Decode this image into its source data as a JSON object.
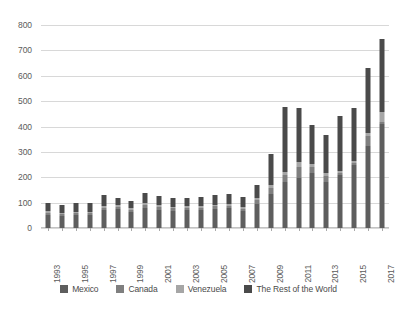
{
  "chart_data": {
    "type": "bar",
    "stacked": true,
    "title": "",
    "subtitle": "",
    "xlabel": "",
    "ylabel": "",
    "ylim": [
      0,
      800
    ],
    "ytick_step": 100,
    "yticks": [
      800,
      700,
      600,
      500,
      400,
      300,
      200,
      100,
      0
    ],
    "grid": true,
    "legend_position": "bottom",
    "categories": [
      "1993",
      "1994",
      "1995",
      "1996",
      "1997",
      "1998",
      "1999",
      "2000",
      "2001",
      "2002",
      "2003",
      "2004",
      "2005",
      "2006",
      "2007",
      "2008",
      "2009",
      "2010",
      "2011",
      "2012",
      "2013",
      "2014",
      "2015",
      "2016",
      "2017"
    ],
    "xtick_labels_shown": [
      "1993",
      "1995",
      "1997",
      "1999",
      "2001",
      "2003",
      "2005",
      "2007",
      "2009",
      "2011",
      "2013",
      "2015",
      "2017"
    ],
    "series": [
      {
        "name": "Mexico",
        "color": "#5e5e5e",
        "values": [
          52,
          48,
          50,
          52,
          70,
          75,
          63,
          80,
          72,
          68,
          70,
          70,
          75,
          78,
          66,
          95,
          135,
          180,
          198,
          215,
          180,
          208,
          248,
          325,
          410
        ]
      },
      {
        "name": "Canada",
        "color": "#7f7f7f",
        "values": [
          8,
          6,
          8,
          8,
          10,
          9,
          8,
          12,
          10,
          9,
          9,
          9,
          10,
          10,
          9,
          14,
          22,
          28,
          44,
          26,
          26,
          8,
          8,
          38,
          8
        ]
      },
      {
        "name": "Venezuela",
        "color": "#a6a6a6",
        "values": [
          6,
          5,
          5,
          5,
          8,
          7,
          6,
          8,
          7,
          6,
          6,
          6,
          7,
          7,
          6,
          10,
          12,
          14,
          18,
          12,
          12,
          8,
          8,
          12,
          38
        ]
      },
      {
        "name": "The Rest of the World",
        "color": "#4a4a4a",
        "values": [
          34,
          32,
          35,
          33,
          44,
          28,
          30,
          38,
          38,
          36,
          34,
          36,
          38,
          41,
          41,
          49,
          122,
          255,
          215,
          154,
          150,
          216,
          209,
          257,
          289
        ]
      }
    ],
    "totals": [
      100,
      91,
      98,
      98,
      132,
      119,
      107,
      138,
      127,
      119,
      119,
      121,
      130,
      136,
      122,
      168,
      291,
      477,
      475,
      407,
      368,
      440,
      473,
      632,
      745
    ]
  },
  "legend": {
    "items": [
      {
        "label": "Mexico"
      },
      {
        "label": "Canada"
      },
      {
        "label": "Venezuela"
      },
      {
        "label": "The Rest of the World"
      }
    ]
  }
}
